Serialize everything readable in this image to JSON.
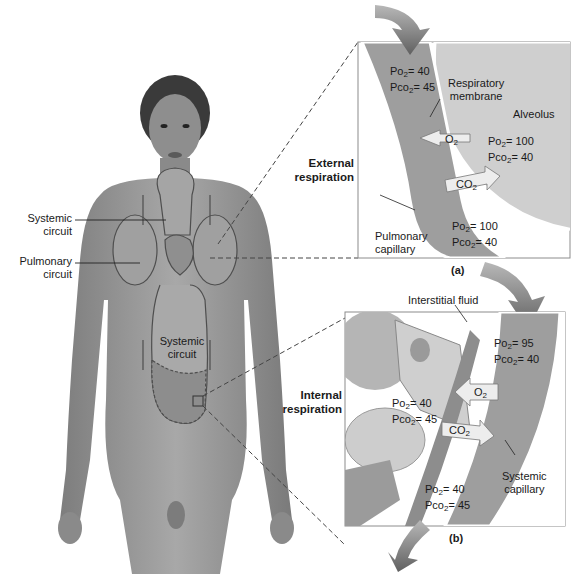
{
  "figure": {
    "body_labels": {
      "systemic_circuit_upper": [
        "Systemic",
        "circuit"
      ],
      "pulmonary_circuit": [
        "Pulmonary",
        "circuit"
      ],
      "systemic_circuit_lower": [
        "Systemic",
        "circuit"
      ]
    },
    "external": {
      "section_label": [
        "External",
        "respiration"
      ],
      "panel_tag": "(a)",
      "respiratory_membrane": [
        "Respiratory",
        "membrane"
      ],
      "alveolus": "Alveolus",
      "pulmonary_capillary": [
        "Pulmonary",
        "capillary"
      ],
      "capillary_in": {
        "po2": "40",
        "pco2": "45"
      },
      "alveolus_vals": {
        "po2": "100",
        "pco2": "40"
      },
      "capillary_out": {
        "po2": "100",
        "pco2": "40"
      },
      "o2_arrow": "O",
      "co2_arrow": "CO"
    },
    "internal": {
      "section_label": [
        "Internal",
        "respiration"
      ],
      "panel_tag": "(b)",
      "interstitial_fluid": "Interstitial fluid",
      "systemic_capillary": [
        "Systemic",
        "capillary"
      ],
      "capillary_in": {
        "po2": "95",
        "pco2": "40"
      },
      "tissue_vals": {
        "po2": "40",
        "pco2": "45"
      },
      "capillary_out": {
        "po2": "40",
        "pco2": "45"
      },
      "o2_arrow": "O",
      "co2_arrow": "CO"
    },
    "symbols": {
      "po": "Po",
      "pco": "Pco",
      "sub2": "2",
      "eq": "= "
    },
    "colors": {
      "skin": "#9a9a9a",
      "capillary": "#9e9e9e",
      "alveolus": "#cfcfcf",
      "panel_border": "#8c8c8c",
      "flow_arrow": "#6f6f6f"
    }
  }
}
